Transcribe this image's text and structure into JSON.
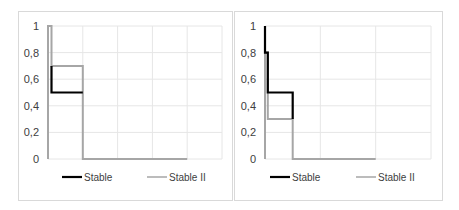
{
  "chart_data": [
    {
      "type": "line",
      "title": "",
      "xlabel": "",
      "ylabel": "",
      "ylim": [
        0,
        1
      ],
      "yticks": [
        "0",
        "0,2",
        "0,4",
        "0,6",
        "0,8",
        "1"
      ],
      "xlim": [
        0,
        5
      ],
      "grid": true,
      "legend_position": "bottom",
      "series": [
        {
          "name": "Stable",
          "color": "#000000",
          "points": [
            [
              0.1,
              0.7
            ],
            [
              0.1,
              0.5
            ],
            [
              1.0,
              0.5
            ]
          ]
        },
        {
          "name": "Stable II",
          "color": "#a6a6a6",
          "points": [
            [
              0.0,
              0.0
            ],
            [
              0.0,
              1.0
            ],
            [
              0.1,
              1.0
            ],
            [
              0.1,
              0.7
            ],
            [
              1.0,
              0.7
            ],
            [
              1.0,
              0.0
            ],
            [
              4.0,
              0.0
            ]
          ]
        }
      ]
    },
    {
      "type": "line",
      "title": "",
      "xlabel": "",
      "ylabel": "",
      "ylim": [
        0,
        1
      ],
      "yticks": [
        "0",
        "0,2",
        "0,4",
        "0,6",
        "0,8",
        "1"
      ],
      "xlim": [
        0,
        3
      ],
      "grid": true,
      "legend_position": "bottom",
      "series": [
        {
          "name": "Stable",
          "color": "#000000",
          "points": [
            [
              0.0,
              1.0
            ],
            [
              0.0,
              0.8
            ],
            [
              0.05,
              0.8
            ],
            [
              0.05,
              0.5
            ],
            [
              0.5,
              0.5
            ],
            [
              0.5,
              0.3
            ]
          ]
        },
        {
          "name": "Stable II",
          "color": "#a6a6a6",
          "points": [
            [
              0.0,
              0.0
            ],
            [
              0.0,
              0.8
            ],
            [
              0.05,
              0.8
            ],
            [
              0.05,
              0.3
            ],
            [
              0.5,
              0.3
            ],
            [
              0.5,
              0.0
            ],
            [
              2.0,
              0.0
            ]
          ]
        }
      ]
    }
  ],
  "legend": {
    "series1": "Stable",
    "series2": "Stable II"
  }
}
